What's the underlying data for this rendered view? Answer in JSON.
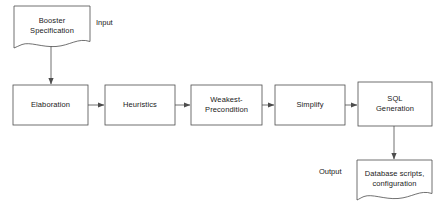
{
  "diagram": {
    "background_color": "#ffffff",
    "stroke_color": "#4d4d4d",
    "text_color": "#1a1a1a",
    "nodes": [
      {
        "id": "booster-specification",
        "label": "Booster\nSpecification",
        "shape": "document",
        "x": 14,
        "y": 6,
        "w": 76,
        "h": 42
      },
      {
        "id": "elaboration",
        "label": "Elaboration",
        "shape": "rectangle",
        "x": 13,
        "y": 85,
        "w": 75,
        "h": 40
      },
      {
        "id": "heuristics",
        "label": "Heuristics",
        "shape": "rectangle",
        "x": 105,
        "y": 85,
        "w": 70,
        "h": 40
      },
      {
        "id": "weakest-precondition",
        "label": "Weakest-\nPrecondition",
        "shape": "rectangle",
        "x": 191,
        "y": 85,
        "w": 71,
        "h": 40
      },
      {
        "id": "simplify",
        "label": "Simplify",
        "shape": "rectangle",
        "x": 275,
        "y": 85,
        "w": 70,
        "h": 40
      },
      {
        "id": "sql-generation",
        "label": "SQL\nGeneration",
        "shape": "rectangle",
        "x": 358,
        "y": 82,
        "w": 74,
        "h": 44
      },
      {
        "id": "database-scripts",
        "label": "Database scripts,\nconfiguration",
        "shape": "document",
        "x": 357,
        "y": 160,
        "w": 75,
        "h": 40
      }
    ],
    "annotations": [
      {
        "id": "input-label",
        "text": "Input",
        "x": 96,
        "y": 18
      },
      {
        "id": "output-label",
        "text": "Output",
        "x": 319,
        "y": 167
      }
    ],
    "edges": [
      {
        "id": "spec-to-elaboration",
        "from": "booster-specification",
        "to": "elaboration",
        "direction": "down"
      },
      {
        "id": "elaboration-to-heuristics",
        "from": "elaboration",
        "to": "heuristics",
        "direction": "right"
      },
      {
        "id": "heuristics-to-weakest-precondition",
        "from": "heuristics",
        "to": "weakest-precondition",
        "direction": "right"
      },
      {
        "id": "weakest-precondition-to-simplify",
        "from": "weakest-precondition",
        "to": "simplify",
        "direction": "right"
      },
      {
        "id": "simplify-to-sql-generation",
        "from": "simplify",
        "to": "sql-generation",
        "direction": "right"
      },
      {
        "id": "sql-generation-to-database-scripts",
        "from": "sql-generation",
        "to": "database-scripts",
        "direction": "down"
      }
    ]
  }
}
